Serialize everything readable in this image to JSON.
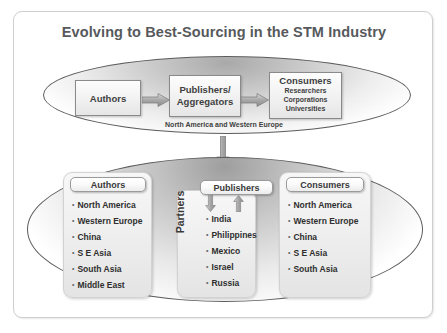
{
  "slide": {
    "title": "Evolving to Best-Sourcing in the STM Industry",
    "accent_color": "#57595c",
    "frame_border_color": "#cfcfcf"
  },
  "top_flow": {
    "caption": "North America and Western Europe",
    "nodes": [
      {
        "label": "Authors"
      },
      {
        "label": "Publishers/\nAggregators",
        "line1": "Publishers/",
        "line2": "Aggregators"
      },
      {
        "label": "Consumers",
        "sub_items": [
          "Researchers",
          "Corporations",
          "Universities"
        ]
      }
    ],
    "connector_icons": [
      "right-block-arrow-icon",
      "right-block-arrow-icon"
    ]
  },
  "vertical_connector": {
    "icon": "down-block-arrow-icon"
  },
  "bottom_flow": {
    "columns": [
      {
        "header": "Authors",
        "items": [
          "North America",
          "Western Europe",
          "China",
          "S E Asia",
          "South Asia",
          "Middle East"
        ]
      },
      {
        "header": "Publishers",
        "side_label": "Partners",
        "items": [
          "India",
          "Philippines",
          "Mexico",
          "Israel",
          "Russia"
        ],
        "arrow_in_icon": "down-block-arrow-icon",
        "arrow_out_icon": "up-block-arrow-icon"
      },
      {
        "header": "Consumers",
        "items": [
          "North America",
          "Western Europe",
          "China",
          "S E Asia",
          "South Asia"
        ]
      }
    ]
  }
}
